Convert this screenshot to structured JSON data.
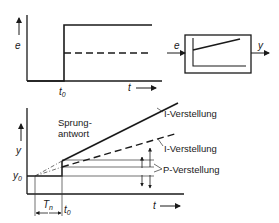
{
  "top_chart": {
    "y_axis_label": "e",
    "x_axis_label": "t",
    "step_time_label": "t",
    "step_time_sub": "0"
  },
  "block": {
    "input_label": "e",
    "output_label": "y"
  },
  "bottom_chart": {
    "y_axis_label": "y",
    "x_axis_label": "t",
    "y0_label": "y",
    "y0_sub": "0",
    "tn_label": "T",
    "tn_sub": "n",
    "t0_label": "t",
    "t0_sub": "0",
    "step_response_line1": "Sprung-",
    "step_response_line2": "antwort",
    "annotations": [
      {
        "label": "I-Verstellung"
      },
      {
        "label": "I-Verstellung"
      },
      {
        "label": "P-Verstellung"
      }
    ]
  },
  "colors": {
    "line": "#1a1a1a",
    "thin": "#333333",
    "background": "#ffffff"
  }
}
